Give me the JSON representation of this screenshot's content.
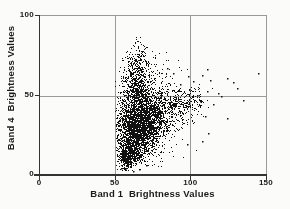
{
  "chart_data": {
    "type": "scatter",
    "title": "",
    "xlabel": "Band 1  Brightness Values",
    "ylabel": "Band 4  Brightness Values",
    "xlim": [
      0,
      150
    ],
    "ylim": [
      0,
      100
    ],
    "xticks": [
      {
        "v": 0,
        "label": "0"
      },
      {
        "v": 50,
        "label": "50"
      },
      {
        "v": 100,
        "label": "100"
      },
      {
        "v": 150,
        "label": "150"
      }
    ],
    "yticks": [
      {
        "v": 0,
        "label": "0"
      },
      {
        "v": 50,
        "label": "50"
      },
      {
        "v": 100,
        "label": "100"
      }
    ],
    "grid": {
      "x": [
        50,
        100
      ],
      "y": [
        50
      ]
    },
    "legend": "none",
    "point_color": "#111111",
    "axis_color": "#333333",
    "frame_color": "#999999",
    "grid_color": "#9a9a9a",
    "background_color": "#fbfbfa",
    "seed": 1973,
    "clusters": [
      {
        "name": "core-main",
        "count": 2800,
        "cx": 66,
        "cy": 32,
        "sx": 8,
        "sy": 11,
        "rho": 0.25,
        "clip_x": [
          51,
          100
        ],
        "clip_y": [
          6,
          55
        ]
      },
      {
        "name": "lower-tip",
        "count": 450,
        "cx": 59,
        "cy": 12,
        "sx": 4,
        "sy": 4.5,
        "rho": 0.2,
        "clip_x": [
          51,
          75
        ],
        "clip_y": [
          3,
          24
        ]
      },
      {
        "name": "right-fan",
        "count": 500,
        "cx": 82,
        "cy": 38,
        "sx": 11,
        "sy": 9,
        "rho": 0.5,
        "clip_x": [
          55,
          108
        ],
        "clip_y": [
          10,
          55
        ]
      },
      {
        "name": "plume",
        "count": 500,
        "cx": 64,
        "cy": 55,
        "sx": 4.5,
        "sy": 8,
        "rho": 0,
        "clip_x": [
          52,
          80
        ],
        "clip_y": [
          45,
          75
        ]
      },
      {
        "name": "plume-top",
        "count": 160,
        "cx": 65,
        "cy": 72,
        "sx": 4,
        "sy": 7,
        "rho": 0,
        "clip_x": [
          54,
          80
        ],
        "clip_y": [
          58,
          87
        ]
      },
      {
        "name": "upper-right-fringe",
        "count": 130,
        "cx": 75,
        "cy": 60,
        "sx": 9,
        "sy": 8,
        "rho": 0,
        "clip_x": [
          55,
          100
        ],
        "clip_y": [
          48,
          80
        ]
      },
      {
        "name": "right-arm",
        "count": 170,
        "cx": 94,
        "cy": 46,
        "sx": 9,
        "sy": 5,
        "rho": 0.15,
        "clip_x": [
          76,
          115
        ],
        "clip_y": [
          33,
          58
        ]
      },
      {
        "name": "halo",
        "count": 220,
        "cx": 66,
        "cy": 34,
        "sx": 13,
        "sy": 17,
        "rho": 0,
        "clip_x": [
          50,
          112
        ],
        "clip_y": [
          2,
          80
        ]
      }
    ],
    "outlier_points": [
      [
        110.8,
        66.5
      ],
      [
        124,
        61.2
      ],
      [
        145,
        64.3
      ],
      [
        130.6,
        54.9
      ],
      [
        118.5,
        51.8
      ],
      [
        110.8,
        52.8
      ],
      [
        106.4,
        46.5
      ],
      [
        115.2,
        44.5
      ],
      [
        109.7,
        37.1
      ],
      [
        124,
        36
      ],
      [
        111.9,
        26.6
      ],
      [
        107.5,
        21.4
      ],
      [
        97.6,
        19.3
      ],
      [
        93.2,
        57
      ],
      [
        98.7,
        62.3
      ],
      [
        88.7,
        64.3
      ],
      [
        84.4,
        67.5
      ],
      [
        120,
        49.5
      ],
      [
        128,
        58.5
      ],
      [
        135,
        47
      ],
      [
        102,
        59
      ],
      [
        104.5,
        50.5
      ],
      [
        99,
        54
      ],
      [
        113,
        59.5
      ],
      [
        108,
        63
      ],
      [
        57,
        3.5
      ],
      [
        62,
        2.5
      ],
      [
        66,
        4
      ],
      [
        71,
        6
      ],
      [
        54,
        4.5
      ]
    ]
  }
}
